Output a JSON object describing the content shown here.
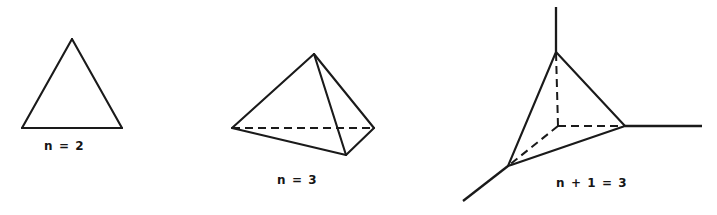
{
  "page": {
    "background_color": "#ffffff",
    "ink_color": "#1a1a1a",
    "width": 717,
    "height": 215
  },
  "figures": [
    {
      "id": "figure-triangle",
      "name": "triangle-2-simplex",
      "caption": "n = 2",
      "caption_x": 44,
      "caption_y": 138,
      "vertices": [
        {
          "name": "apex",
          "x": 72,
          "y": 39
        },
        {
          "name": "bottom-left",
          "x": 22,
          "y": 128
        },
        {
          "name": "bottom-right",
          "x": 122,
          "y": 128
        }
      ],
      "solid_edges": [
        [
          72,
          39,
          22,
          128
        ],
        [
          22,
          128,
          122,
          128
        ],
        [
          122,
          128,
          72,
          39
        ]
      ],
      "dashed_edges": [],
      "rays": []
    },
    {
      "id": "figure-tetrahedron",
      "name": "tetrahedron-3-simplex",
      "caption": "n = 3",
      "caption_x": 277,
      "caption_y": 172,
      "vertices": [
        {
          "name": "apex",
          "x": 314,
          "y": 54
        },
        {
          "name": "left",
          "x": 232,
          "y": 128
        },
        {
          "name": "right",
          "x": 374,
          "y": 128
        },
        {
          "name": "front-bottom",
          "x": 346,
          "y": 155
        }
      ],
      "solid_edges": [
        [
          314,
          54,
          232,
          128
        ],
        [
          314,
          54,
          374,
          128
        ],
        [
          314,
          54,
          346,
          155
        ],
        [
          232,
          128,
          346,
          155
        ],
        [
          374,
          128,
          346,
          155
        ]
      ],
      "dashed_edges": [
        [
          232,
          128,
          374,
          128
        ]
      ],
      "rays": []
    },
    {
      "id": "figure-dual-star",
      "name": "dual-star-configuration",
      "caption": "n + 1 = 3",
      "caption_x": 556,
      "caption_y": 175,
      "vertices": [
        {
          "name": "top",
          "x": 556,
          "y": 52
        },
        {
          "name": "right",
          "x": 625,
          "y": 126
        },
        {
          "name": "left",
          "x": 508,
          "y": 166
        },
        {
          "name": "center",
          "x": 558,
          "y": 126
        }
      ],
      "solid_edges": [
        [
          556,
          52,
          508,
          166
        ],
        [
          556,
          52,
          625,
          126
        ],
        [
          508,
          166,
          625,
          126
        ]
      ],
      "dashed_edges": [
        [
          558,
          126,
          556,
          52
        ],
        [
          558,
          126,
          625,
          126
        ],
        [
          558,
          126,
          508,
          166
        ]
      ],
      "rays": [
        {
          "name": "ray-up",
          "x1": 556,
          "y1": 52,
          "x2": 556,
          "y2": 7
        },
        {
          "name": "ray-right",
          "x1": 625,
          "y1": 126,
          "x2": 702,
          "y2": 126
        },
        {
          "name": "ray-lower-left",
          "x1": 508,
          "y1": 166,
          "x2": 463,
          "y2": 201
        }
      ]
    }
  ]
}
